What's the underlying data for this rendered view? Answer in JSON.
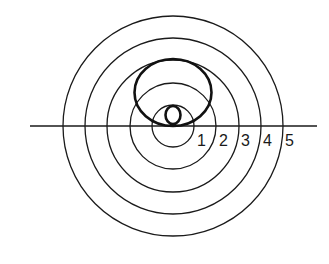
{
  "diagram": {
    "center": {
      "x": 173,
      "y": 126
    },
    "rings": [
      {
        "label": "1",
        "radius": 22
      },
      {
        "label": "2",
        "radius": 45
      },
      {
        "label": "3",
        "radius": 67
      },
      {
        "label": "4",
        "radius": 89
      },
      {
        "label": "5",
        "radius": 112
      }
    ],
    "colors": {
      "stroke": "#1a1a1a",
      "background": "#ffffff"
    }
  },
  "labels": {
    "ring1": "1",
    "ring2": "2",
    "ring3": "3",
    "ring4": "4",
    "ring5": "5"
  }
}
